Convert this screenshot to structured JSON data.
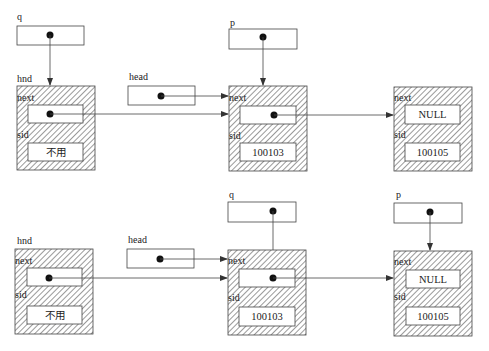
{
  "diagram": {
    "type": "linked-list-insertion",
    "colors": {
      "line": "#444444",
      "hatch": "#555555",
      "background": "#ffffff",
      "dot": "#111111"
    },
    "top": {
      "pointers": [
        {
          "id": "q",
          "label": "q",
          "targets": "hnd"
        },
        {
          "id": "head",
          "label": "head",
          "targets": "node-100103"
        },
        {
          "id": "p",
          "label": "p",
          "targets": "node-100103"
        }
      ],
      "nodes": [
        {
          "id": "hnd",
          "label": "hnd",
          "next_label": "next",
          "sid_label": "sid",
          "next_value": "",
          "sid_value": "不用",
          "next_targets": "node-100103"
        },
        {
          "id": "node-100103",
          "label": "",
          "next_label": "next",
          "sid_label": "sid",
          "next_value": "",
          "sid_value": "100103",
          "next_targets": "node-100105"
        },
        {
          "id": "node-100105",
          "label": "",
          "next_label": "next",
          "sid_label": "sid",
          "next_value": "NULL",
          "sid_value": "100105"
        }
      ]
    },
    "bottom": {
      "pointers": [
        {
          "id": "head",
          "label": "head",
          "targets": "node-100103"
        },
        {
          "id": "q",
          "label": "q",
          "targets": "node-100103"
        },
        {
          "id": "p",
          "label": "p",
          "targets": "node-100105"
        }
      ],
      "nodes": [
        {
          "id": "hnd",
          "label": "hnd",
          "next_label": "next",
          "sid_label": "sid",
          "next_value": "",
          "sid_value": "不用",
          "next_targets": "node-100103"
        },
        {
          "id": "node-100103",
          "label": "",
          "next_label": "next",
          "sid_label": "sid",
          "next_value": "",
          "sid_value": "100103",
          "next_targets": "node-100105"
        },
        {
          "id": "node-100105",
          "label": "",
          "next_label": "next",
          "sid_label": "sid",
          "next_value": "NULL",
          "sid_value": "100105"
        }
      ]
    }
  }
}
